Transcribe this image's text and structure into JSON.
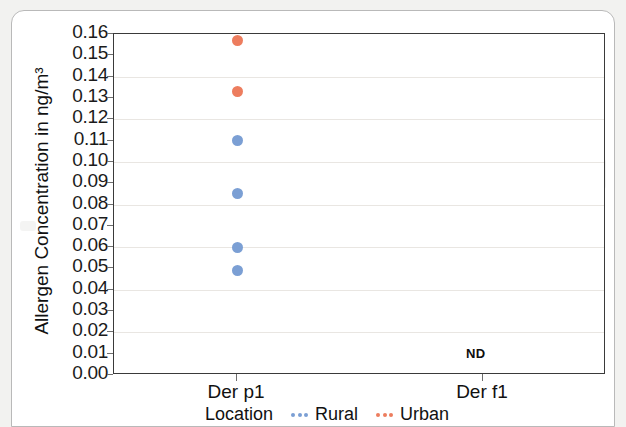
{
  "chart_data": {
    "type": "scatter",
    "title": "",
    "xlabel": "Location",
    "ylabel": "Allergen Concentration in ng/m³",
    "categories": [
      "Der p1",
      "Der f1"
    ],
    "ylim": [
      0.0,
      0.16
    ],
    "ytick_step": 0.01,
    "grid": true,
    "legend_position": "bottom",
    "legend_title": "Location",
    "annotations": [
      {
        "text": "ND",
        "category": "Der f1",
        "value": 0.009
      }
    ],
    "series": [
      {
        "name": "Rural",
        "color": "#7B9FD4",
        "points": [
          {
            "category": "Der p1",
            "value": 0.11
          },
          {
            "category": "Der p1",
            "value": 0.085
          },
          {
            "category": "Der p1",
            "value": 0.06
          },
          {
            "category": "Der p1",
            "value": 0.049
          }
        ]
      },
      {
        "name": "Urban",
        "color": "#ED7D5E",
        "points": [
          {
            "category": "Der p1",
            "value": 0.157
          },
          {
            "category": "Der p1",
            "value": 0.133
          }
        ]
      }
    ],
    "ytick_labels": [
      "0.16",
      "0.15",
      "0.14",
      "0.13",
      "0.12",
      "0.11",
      "0.10",
      "0.09",
      "0.08",
      "0.07",
      "0.06",
      "0.05",
      "0.04",
      "0.03",
      "0.02",
      "0.01",
      "0.00"
    ]
  },
  "axis": {
    "y_title": "Allergen Concentration in ng/m³",
    "x_title": "Location",
    "x_categories": [
      "Der p1",
      "Der f1"
    ]
  },
  "legend": {
    "title": "Location",
    "items": [
      {
        "label": "Rural",
        "color": "#7B9FD4"
      },
      {
        "label": "Urban",
        "color": "#ED7D5E"
      }
    ]
  },
  "annotation": {
    "nd_label": "ND"
  }
}
